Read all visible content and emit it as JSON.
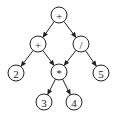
{
  "diagram": {
    "type": "expression-tree-dag",
    "nodes": [
      {
        "id": "n_plus_top",
        "label": "+",
        "x": 59,
        "y": 15
      },
      {
        "id": "n_plus_left",
        "label": "+",
        "x": 38,
        "y": 44
      },
      {
        "id": "n_div",
        "label": "/",
        "x": 81,
        "y": 44
      },
      {
        "id": "n_two",
        "label": "2",
        "x": 16,
        "y": 73
      },
      {
        "id": "n_mul",
        "label": "*",
        "x": 59,
        "y": 72
      },
      {
        "id": "n_five",
        "label": "5",
        "x": 101,
        "y": 73
      },
      {
        "id": "n_three",
        "label": "3",
        "x": 44,
        "y": 102
      },
      {
        "id": "n_four",
        "label": "4",
        "x": 74,
        "y": 102
      }
    ],
    "edges": [
      {
        "from": "n_plus_top",
        "to": "n_plus_left"
      },
      {
        "from": "n_plus_top",
        "to": "n_div"
      },
      {
        "from": "n_plus_left",
        "to": "n_two"
      },
      {
        "from": "n_plus_left",
        "to": "n_mul"
      },
      {
        "from": "n_div",
        "to": "n_mul"
      },
      {
        "from": "n_div",
        "to": "n_five"
      },
      {
        "from": "n_mul",
        "to": "n_three"
      },
      {
        "from": "n_mul",
        "to": "n_four"
      }
    ],
    "node_radius": 8,
    "stroke_color": "#222222"
  }
}
